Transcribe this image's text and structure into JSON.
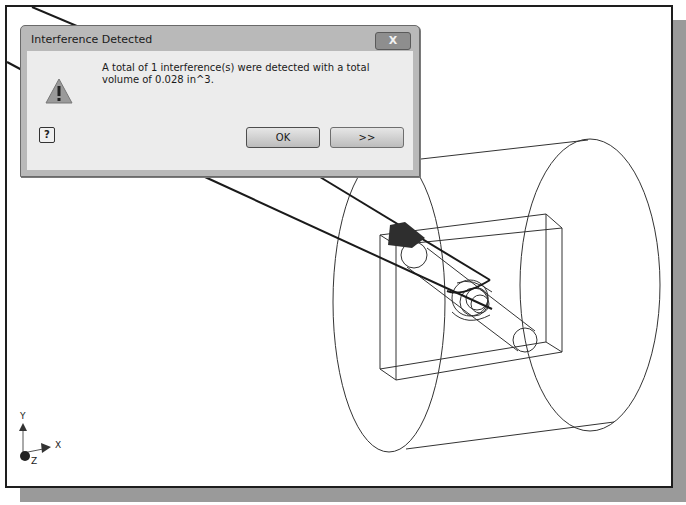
{
  "dialog": {
    "title": "Interference Detected",
    "close_label": "X",
    "icon": "warning-icon",
    "message_line1": "A total of 1 interference(s) were detected with a total",
    "message_line2": "volume of 0.028 in^3.",
    "help_label": "?",
    "ok_label": "OK",
    "more_label": ">>"
  },
  "triad": {
    "x_label": "X",
    "y_label": "Y",
    "z_label": "Z"
  },
  "colors": {
    "viewport_bg": "#ffffff",
    "frame": "#1e1e1e",
    "shadow": "#9a9a9a",
    "dialog_chrome": "#b9b9b9",
    "dialog_body": "#ececec",
    "interference_region": "#2e2e2e"
  }
}
